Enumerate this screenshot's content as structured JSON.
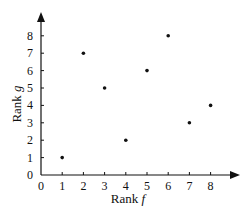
{
  "chart_data": {
    "type": "scatter",
    "title": "",
    "xlabel": "Rank f",
    "ylabel": "Rank g",
    "x_label_text": "Rank ",
    "x_label_var": "f",
    "y_label_text": "Rank ",
    "y_label_var": "g",
    "xlim": [
      0,
      8
    ],
    "ylim": [
      0,
      8
    ],
    "x_ticks": [
      0,
      1,
      2,
      3,
      4,
      5,
      6,
      7,
      8
    ],
    "y_ticks": [
      0,
      1,
      2,
      3,
      4,
      5,
      6,
      7,
      8
    ],
    "grid": false,
    "legend": null,
    "points": [
      {
        "x": 1,
        "y": 1
      },
      {
        "x": 2,
        "y": 7
      },
      {
        "x": 3,
        "y": 5
      },
      {
        "x": 4,
        "y": 2
      },
      {
        "x": 5,
        "y": 6
      },
      {
        "x": 6,
        "y": 8
      },
      {
        "x": 7,
        "y": 3
      },
      {
        "x": 8,
        "y": 4
      }
    ],
    "colors": {
      "axis": "#111111",
      "points": "#111111"
    }
  }
}
